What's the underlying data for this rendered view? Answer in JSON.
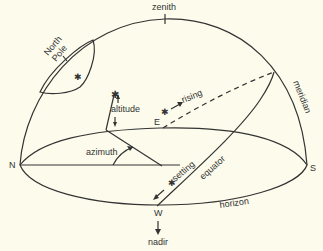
{
  "diagram": {
    "labels": {
      "zenith": "zenith",
      "north_pole": "North Pole",
      "north_line1": "North",
      "north_line2": "Pole",
      "altitude": "altitude",
      "rising": "rising",
      "east": "E",
      "meridian": "meridian",
      "north": "N",
      "azimuth": "azimuth",
      "setting": "setting",
      "equator": "equator",
      "south": "S",
      "west": "W",
      "horizon": "horizon",
      "nadir": "nadir"
    },
    "colors": {
      "background": "#fcfbec",
      "line": "#333333"
    }
  }
}
